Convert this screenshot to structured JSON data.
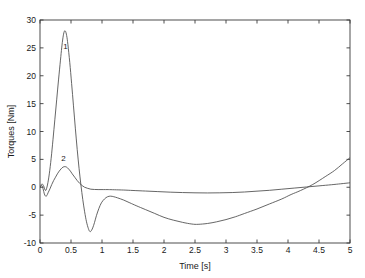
{
  "chart_data": {
    "type": "line",
    "title": "",
    "xlabel": "Time [s]",
    "ylabel": "Torques [Nm]",
    "xlim": [
      0,
      5
    ],
    "ylim": [
      -10,
      30
    ],
    "grid": false,
    "legend_position": "inline-annotations",
    "xticks": [
      0,
      0.5,
      1,
      1.5,
      2,
      2.5,
      3,
      3.5,
      4,
      4.5,
      5
    ],
    "xtick_labels": [
      "0",
      "0.5",
      "1",
      "1.5",
      "2",
      "2.5",
      "3",
      "3.5",
      "4",
      "4.5",
      "5"
    ],
    "yticks": [
      -10,
      -5,
      0,
      5,
      10,
      15,
      20,
      25,
      30
    ],
    "ytick_labels": [
      "-10",
      "-5",
      "0",
      "5",
      "10",
      "15",
      "20",
      "25",
      "30"
    ],
    "annotations": [
      {
        "text": "1",
        "x": 0.41,
        "y": 25.3,
        "name": "curve-1-label"
      },
      {
        "text": "2",
        "x": 0.38,
        "y": 5.2,
        "name": "curve-2-label"
      }
    ],
    "series": [
      {
        "name": "1",
        "color": "#4a4a4a",
        "points": [
          [
            0.0,
            0.0
          ],
          [
            0.03,
            0.6
          ],
          [
            0.06,
            0.2
          ],
          [
            0.09,
            -0.6
          ],
          [
            0.12,
            0.4
          ],
          [
            0.15,
            2.4
          ],
          [
            0.18,
            5.2
          ],
          [
            0.21,
            8.6
          ],
          [
            0.24,
            12.2
          ],
          [
            0.27,
            15.8
          ],
          [
            0.3,
            19.4
          ],
          [
            0.33,
            22.8
          ],
          [
            0.35,
            25.0
          ],
          [
            0.37,
            26.8
          ],
          [
            0.39,
            27.9
          ],
          [
            0.41,
            28.0
          ],
          [
            0.43,
            27.2
          ],
          [
            0.45,
            25.6
          ],
          [
            0.48,
            22.4
          ],
          [
            0.51,
            18.6
          ],
          [
            0.54,
            14.6
          ],
          [
            0.57,
            10.6
          ],
          [
            0.6,
            6.8
          ],
          [
            0.63,
            3.4
          ],
          [
            0.66,
            0.4
          ],
          [
            0.69,
            -2.2
          ],
          [
            0.72,
            -4.4
          ],
          [
            0.75,
            -6.2
          ],
          [
            0.78,
            -7.4
          ],
          [
            0.8,
            -7.9
          ],
          [
            0.82,
            -7.9
          ],
          [
            0.85,
            -7.3
          ],
          [
            0.88,
            -6.3
          ],
          [
            0.91,
            -5.1
          ],
          [
            0.95,
            -3.8
          ],
          [
            0.99,
            -2.8
          ],
          [
            1.04,
            -2.1
          ],
          [
            1.09,
            -1.7
          ],
          [
            1.14,
            -1.6
          ],
          [
            1.19,
            -1.7
          ],
          [
            1.25,
            -1.9
          ],
          [
            1.35,
            -2.3
          ],
          [
            1.45,
            -2.8
          ],
          [
            1.55,
            -3.3
          ],
          [
            1.7,
            -4.0
          ],
          [
            1.85,
            -4.7
          ],
          [
            2.0,
            -5.4
          ],
          [
            2.15,
            -5.9
          ],
          [
            2.3,
            -6.3
          ],
          [
            2.45,
            -6.6
          ],
          [
            2.55,
            -6.65
          ],
          [
            2.7,
            -6.5
          ],
          [
            2.85,
            -6.2
          ],
          [
            3.0,
            -5.8
          ],
          [
            3.15,
            -5.3
          ],
          [
            3.3,
            -4.7
          ],
          [
            3.5,
            -3.9
          ],
          [
            3.7,
            -3.0
          ],
          [
            3.9,
            -2.1
          ],
          [
            4.05,
            -1.3
          ],
          [
            4.2,
            -0.6
          ],
          [
            4.4,
            0.5
          ],
          [
            4.6,
            1.9
          ],
          [
            4.75,
            3.0
          ],
          [
            4.88,
            4.2
          ],
          [
            5.0,
            5.3
          ]
        ]
      },
      {
        "name": "2",
        "color": "#4a4a4a",
        "points": [
          [
            0.0,
            0.0
          ],
          [
            0.03,
            0.3
          ],
          [
            0.05,
            -0.3
          ],
          [
            0.07,
            -1.2
          ],
          [
            0.09,
            -1.6
          ],
          [
            0.11,
            -1.5
          ],
          [
            0.13,
            -1.0
          ],
          [
            0.16,
            -0.3
          ],
          [
            0.19,
            0.5
          ],
          [
            0.22,
            1.2
          ],
          [
            0.25,
            1.8
          ],
          [
            0.28,
            2.4
          ],
          [
            0.31,
            2.9
          ],
          [
            0.34,
            3.3
          ],
          [
            0.37,
            3.6
          ],
          [
            0.4,
            3.7
          ],
          [
            0.43,
            3.6
          ],
          [
            0.46,
            3.3
          ],
          [
            0.49,
            2.9
          ],
          [
            0.52,
            2.4
          ],
          [
            0.56,
            1.8
          ],
          [
            0.6,
            1.2
          ],
          [
            0.64,
            0.7
          ],
          [
            0.68,
            0.3
          ],
          [
            0.72,
            0.0
          ],
          [
            0.77,
            -0.2
          ],
          [
            0.82,
            -0.35
          ],
          [
            0.88,
            -0.4
          ],
          [
            0.95,
            -0.42
          ],
          [
            1.02,
            -0.42
          ],
          [
            1.1,
            -0.42
          ],
          [
            1.2,
            -0.45
          ],
          [
            1.35,
            -0.5
          ],
          [
            1.5,
            -0.58
          ],
          [
            1.7,
            -0.68
          ],
          [
            1.9,
            -0.78
          ],
          [
            2.1,
            -0.88
          ],
          [
            2.3,
            -0.95
          ],
          [
            2.5,
            -1.0
          ],
          [
            2.7,
            -1.02
          ],
          [
            2.9,
            -1.0
          ],
          [
            3.1,
            -0.95
          ],
          [
            3.3,
            -0.85
          ],
          [
            3.5,
            -0.7
          ],
          [
            3.7,
            -0.55
          ],
          [
            3.9,
            -0.35
          ],
          [
            4.1,
            -0.15
          ],
          [
            4.3,
            0.05
          ],
          [
            4.5,
            0.25
          ],
          [
            4.7,
            0.45
          ],
          [
            4.85,
            0.62
          ],
          [
            5.0,
            0.8
          ]
        ]
      }
    ]
  },
  "plot_geometry": {
    "left": 40,
    "right": 350,
    "top": 20,
    "bottom": 243
  }
}
